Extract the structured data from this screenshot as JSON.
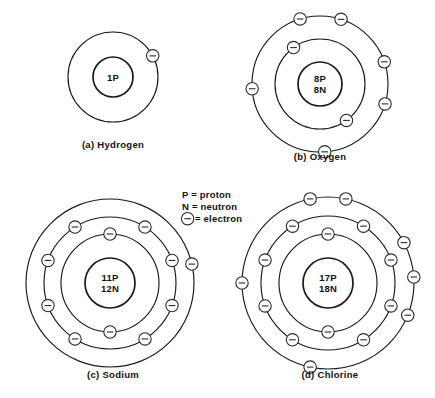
{
  "figure": {
    "background_color": "#ffffff",
    "line_color": "#1a1a1a",
    "width": 435,
    "height": 398
  },
  "legend": {
    "name": "symbol-key",
    "x": 182,
    "y": 198,
    "line_height": 12,
    "entries": [
      {
        "symbol": "P",
        "glyph_type": "text",
        "text": "P = proton"
      },
      {
        "symbol": "N",
        "glyph_type": "text",
        "text": "N = neutron"
      },
      {
        "symbol": "electron",
        "glyph_type": "electron-icon",
        "text": "= electron"
      }
    ]
  },
  "electron_icon": {
    "radius": 6.2,
    "bar_half_width": 3.3,
    "fill": "#ffffff",
    "stroke": "#2a2a2a"
  },
  "atoms": [
    {
      "id": "hydrogen",
      "caption": "(a)  Hydrogen",
      "element": "Hydrogen",
      "cx": 113,
      "cy": 77,
      "caption_x": 113,
      "caption_y": 148,
      "nucleus": {
        "radius": 20,
        "lines": [
          "1P"
        ],
        "protons": 1,
        "neutrons": 0
      },
      "shells": [
        {
          "index": 1,
          "radius": 45,
          "electron_count": 1,
          "electron_angles": [
            -28
          ]
        }
      ]
    },
    {
      "id": "oxygen",
      "caption": "(b)  Oxygen",
      "element": "Oxygen",
      "cx": 320,
      "cy": 84,
      "caption_x": 320,
      "caption_y": 160,
      "nucleus": {
        "radius": 22,
        "lines": [
          "8P",
          "8N"
        ],
        "protons": 8,
        "neutrons": 8
      },
      "shells": [
        {
          "index": 1,
          "radius": 45,
          "electron_count": 2,
          "electron_angles": [
            -126,
            54
          ]
        },
        {
          "index": 2,
          "radius": 68,
          "electron_count": 6,
          "electron_angles": [
            -107,
            -72,
            -19,
            17,
            86,
            176
          ]
        }
      ]
    },
    {
      "id": "sodium",
      "caption": "(c)  Sodium",
      "element": "Sodium",
      "cx": 110,
      "cy": 283,
      "caption_x": 113,
      "caption_y": 378,
      "nucleus": {
        "radius": 25,
        "lines": [
          "11P",
          "12N"
        ],
        "protons": 11,
        "neutrons": 12
      },
      "shells": [
        {
          "index": 1,
          "radius": 49,
          "electron_count": 2,
          "electron_angles": [
            -90,
            90
          ]
        },
        {
          "index": 2,
          "radius": 66,
          "electron_count": 8,
          "electron_angles": [
            -122,
            -58,
            -20,
            20,
            58,
            122,
            160,
            200
          ]
        },
        {
          "index": 3,
          "radius": 84,
          "electron_count": 1,
          "electron_angles": [
            -13
          ]
        }
      ]
    },
    {
      "id": "chlorine",
      "caption": "(d)  Chlorine",
      "element": "Chlorine",
      "cx": 328,
      "cy": 283,
      "caption_x": 330,
      "caption_y": 378,
      "nucleus": {
        "radius": 25,
        "lines": [
          "17P",
          "18N"
        ],
        "protons": 17,
        "neutrons": 18
      },
      "shells": [
        {
          "index": 1,
          "radius": 49,
          "electron_count": 2,
          "electron_angles": [
            -90,
            90
          ]
        },
        {
          "index": 2,
          "radius": 67,
          "electron_count": 8,
          "electron_angles": [
            -122,
            -58,
            -20,
            20,
            58,
            122,
            160,
            200
          ]
        },
        {
          "index": 3,
          "radius": 86,
          "electron_count": 7,
          "electron_angles": [
            -102,
            -78,
            -28,
            -4,
            22,
            102,
            180
          ]
        }
      ]
    }
  ]
}
